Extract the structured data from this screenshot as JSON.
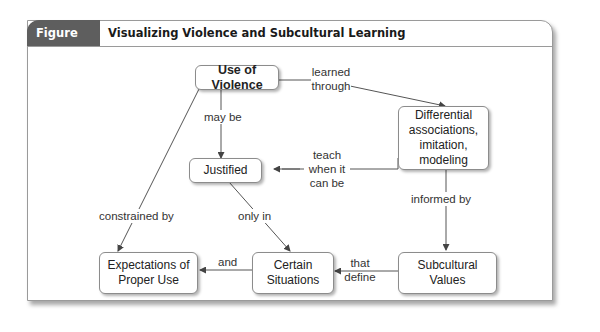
{
  "figure": {
    "label": "Figure 6.6",
    "title": "Visualizing Violence and Subcultural Learning"
  },
  "nodes": {
    "use_of_violence": "Use of Violence",
    "differential": "Differential associations, imitation, modeling",
    "differential_lines": [
      "Differential",
      "associations,",
      "imitation,",
      "modeling"
    ],
    "justified": "Justified",
    "expectations": "Expectations of Proper Use",
    "certain_situations": "Certain Situations",
    "subcultural_values": "Subcultural Values"
  },
  "edges": {
    "learned_through": "learned through",
    "may_be": "may be",
    "teach_when": "teach when it can be",
    "informed_by": "informed by",
    "constrained_by": "constrained by",
    "only_in": "only in",
    "and": "and",
    "that_define": "that define"
  },
  "colors": {
    "header_label_bg": "#5e5e5e",
    "border": "#9a9a9a",
    "line": "#555555"
  }
}
